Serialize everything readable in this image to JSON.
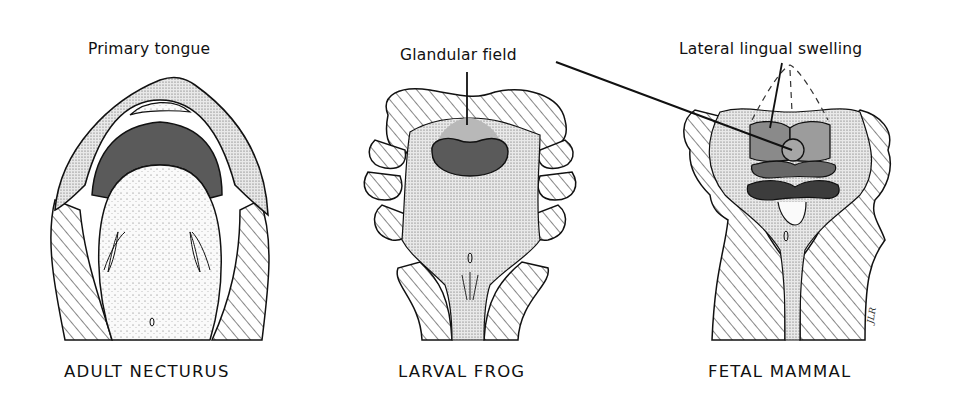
{
  "figure": {
    "labels": {
      "primary_tongue": "Primary tongue",
      "glandular_field": "Glandular field",
      "lateral_lingual_swelling": "Lateral lingual swelling"
    },
    "captions": [
      {
        "id": "necturus",
        "text": "ADULT NECTURUS"
      },
      {
        "id": "frog",
        "text": "LARVAL FROG"
      },
      {
        "id": "mammal",
        "text": "FETAL MAMMAL"
      }
    ],
    "signature": "JLR",
    "colors": {
      "outline": "#111111",
      "dark_gray": "#5a5a5a",
      "mid_gray": "#8a8a8a",
      "light_gray": "#b8b8b8",
      "darkest_gray": "#3c3c3c",
      "background": "#ffffff"
    }
  }
}
